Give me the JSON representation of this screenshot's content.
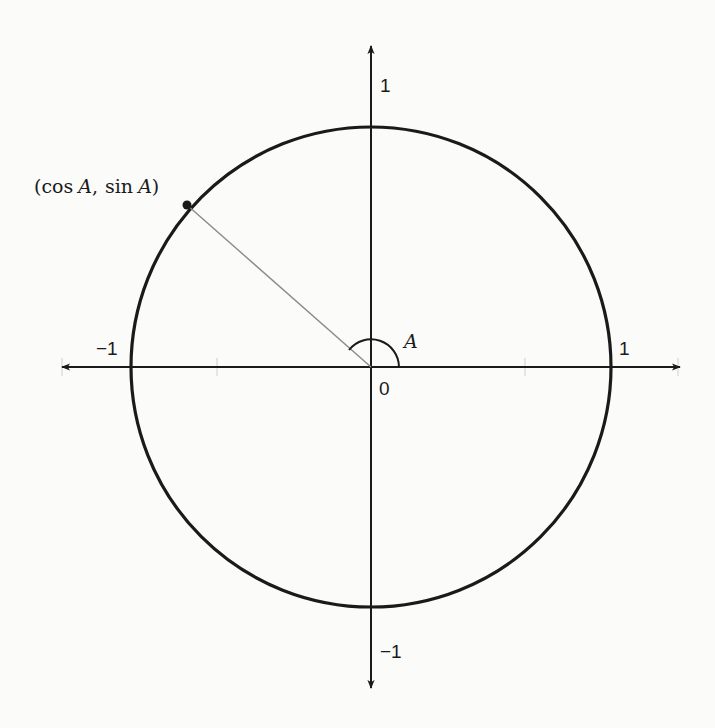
{
  "diagram": {
    "colors": {
      "stroke": "#1a1a1a",
      "radius_line": "#8a8a8a",
      "background": "#fbfbfa"
    },
    "origin_px": [
      371,
      367
    ],
    "radius_px": 240,
    "angle_deg": 142,
    "labels": {
      "origin": "0",
      "x_positive": "1",
      "x_negative": "−1",
      "y_positive": "1",
      "y_negative": "−1",
      "angle": "A",
      "point_open": "(",
      "point_cos": "cos",
      "point_var1": "A",
      "point_sep": ",",
      "point_sin": "sin",
      "point_var2": "A",
      "point_close": ")"
    },
    "elements": [
      "x-axis with arrows both ends",
      "y-axis with arrows both ends",
      "unit circle",
      "radius line to point (cos A, sin A)",
      "angle arc A at origin"
    ]
  }
}
